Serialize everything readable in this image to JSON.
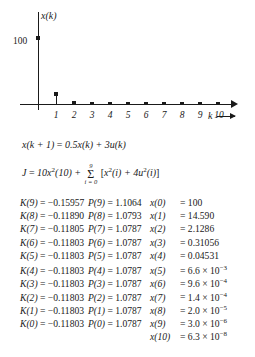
{
  "chart_data": {
    "type": "scatter",
    "title": "",
    "ylabel": "x(k)",
    "xlabel": "k",
    "x": [
      0,
      1,
      2,
      3,
      4,
      5,
      6,
      7,
      8,
      9,
      10
    ],
    "values": [
      100,
      14.59,
      2.1286,
      0.31056,
      0.04531,
      0.0066,
      0.00096,
      0.00014,
      2e-05,
      3e-06,
      6.3e-08
    ],
    "categories": [
      "0",
      "1",
      "2",
      "3",
      "4",
      "5",
      "6",
      "7",
      "8",
      "9",
      "10"
    ],
    "xtick_labels": [
      "1",
      "2",
      "3",
      "4",
      "5",
      "6",
      "7",
      "8",
      "9",
      "10"
    ],
    "ytick_labels": [
      "100"
    ],
    "ylim": [
      0,
      108
    ],
    "xlim": [
      0,
      11
    ],
    "grid": false,
    "legend": "none"
  },
  "plot": {
    "ylabel": "x(k)",
    "ytick_100": "100",
    "xlabel": "k",
    "xticks": [
      "1",
      "2",
      "3",
      "4",
      "5",
      "6",
      "7",
      "8",
      "9",
      "10"
    ]
  },
  "equations": {
    "state": {
      "lhs": "x(k + 1)",
      "eq": "=",
      "rhs": "0.5x(k) + 3u(k)"
    },
    "cost": {
      "lhs": "J",
      "eq": "=",
      "first_term": "10x",
      "first_term_exp": "2",
      "first_term_arg": "(10) +",
      "sigma_upper": "9",
      "sigma_symbol": "Σ",
      "sigma_lower": "i = 0",
      "bracket_open": "[",
      "term1": "x",
      "term1_exp": "2",
      "term1_arg": "(i) + 4u",
      "term2_exp": "2",
      "term2_arg": "(i)",
      "bracket_close": "]"
    }
  },
  "results": {
    "rows": [
      {
        "k_label": "K(9)",
        "k_eq": "=",
        "k_value": "−0.15957",
        "p_label": "P(9)",
        "p_eq": "=",
        "p_value": "1.1064",
        "x_label": "x(0)",
        "x_eq": "=",
        "x_value": "100"
      },
      {
        "k_label": "K(8)",
        "k_eq": "=",
        "k_value": "−0.11890",
        "p_label": "P(8)",
        "p_eq": "=",
        "p_value": "1.0793",
        "x_label": "x(1)",
        "x_eq": "=",
        "x_value": "14.590"
      },
      {
        "k_label": "K(7)",
        "k_eq": "=",
        "k_value": "−0.11805",
        "p_label": "P(7)",
        "p_eq": "=",
        "p_value": "1.0787",
        "x_label": "x(2)",
        "x_eq": "=",
        "x_value": "2.1286"
      },
      {
        "k_label": "K(6)",
        "k_eq": "=",
        "k_value": "−0.11803",
        "p_label": "P(6)",
        "p_eq": "=",
        "p_value": "1.0787",
        "x_label": "x(3)",
        "x_eq": "=",
        "x_value": "0.31056"
      },
      {
        "k_label": "K(5)",
        "k_eq": "=",
        "k_value": "−0.11803",
        "p_label": "P(5)",
        "p_eq": "=",
        "p_value": "1.0787",
        "x_label": "x(4)",
        "x_eq": "=",
        "x_value": "0.04531"
      },
      {
        "k_label": "K(4)",
        "k_eq": "=",
        "k_value": "−0.11803",
        "p_label": "P(4)",
        "p_eq": "=",
        "p_value": "1.0787",
        "x_label": "x(5)",
        "x_eq": "=",
        "x_mantissa": "6.6",
        "x_times": "×",
        "x_base": "10",
        "x_exp": "−3"
      },
      {
        "k_label": "K(3)",
        "k_eq": "=",
        "k_value": "−0.11803",
        "p_label": "P(3)",
        "p_eq": "=",
        "p_value": "1.0787",
        "x_label": "x(6)",
        "x_eq": "=",
        "x_mantissa": "9.6",
        "x_times": "×",
        "x_base": "10",
        "x_exp": "−4"
      },
      {
        "k_label": "K(2)",
        "k_eq": "=",
        "k_value": "−0.11803",
        "p_label": "P(2)",
        "p_eq": "=",
        "p_value": "1.0787",
        "x_label": "x(7)",
        "x_eq": "=",
        "x_mantissa": "1.4",
        "x_times": "×",
        "x_base": "10",
        "x_exp": "−4"
      },
      {
        "k_label": "K(1)",
        "k_eq": "=",
        "k_value": "−0.11803",
        "p_label": "P(1)",
        "p_eq": "=",
        "p_value": "1.0787",
        "x_label": "x(8)",
        "x_eq": "=",
        "x_mantissa": "2.0",
        "x_times": "×",
        "x_base": "10",
        "x_exp": "−5"
      },
      {
        "k_label": "K(0)",
        "k_eq": "=",
        "k_value": "−0.11803",
        "p_label": "P(0)",
        "p_eq": "=",
        "p_value": "1.0787",
        "x_label": "x(9)",
        "x_eq": "=",
        "x_mantissa": "3.0",
        "x_times": "×",
        "x_base": "10",
        "x_exp": "−6"
      },
      {
        "k_label": "",
        "k_eq": "",
        "k_value": "",
        "p_label": "",
        "p_eq": "",
        "p_value": "",
        "x_label": "x(10)",
        "x_eq": "=",
        "x_mantissa": "6.3",
        "x_times": "×",
        "x_base": "10",
        "x_exp": "−8"
      }
    ]
  }
}
